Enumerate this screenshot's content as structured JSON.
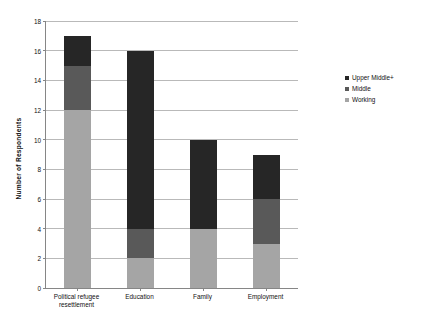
{
  "chart_data": {
    "type": "bar",
    "subtype": "stacked-vertical",
    "title": "",
    "xlabel": "",
    "ylabel": "Number of Respondents",
    "ylim": [
      0,
      18
    ],
    "ytick_step": 2,
    "yticks": [
      0,
      2,
      4,
      6,
      8,
      10,
      12,
      14,
      16,
      18
    ],
    "ytick_labels": [
      "0",
      "2",
      "4",
      "6",
      "8",
      "10",
      "12",
      "14",
      "16",
      "18"
    ],
    "grid": true,
    "grid_axis": "y",
    "legend_position": "right",
    "categories": [
      "Political refugee resettlement",
      "Education",
      "Family",
      "Employment"
    ],
    "category_label_lines": [
      [
        "Political refugee",
        "resettlement"
      ],
      [
        "Education"
      ],
      [
        "Family"
      ],
      [
        "Employment"
      ]
    ],
    "series": [
      {
        "name": "Working",
        "color": "#a5a5a5",
        "values": [
          12,
          2,
          4,
          3
        ]
      },
      {
        "name": "Middle",
        "color": "#595959",
        "values": [
          3,
          2,
          0,
          3
        ]
      },
      {
        "name": "Upper Middle+",
        "color": "#262626",
        "values": [
          2,
          12,
          6,
          3
        ]
      }
    ],
    "stack_totals": [
      17,
      16,
      10,
      9
    ],
    "legend_entries": [
      {
        "label": "Upper Middle+",
        "color": "#262626"
      },
      {
        "label": "Middle",
        "color": "#595959"
      },
      {
        "label": "Working",
        "color": "#a5a5a5"
      }
    ]
  },
  "colors": {
    "axis": "#868686",
    "gridline": "#b9b9b9",
    "text": "#111111",
    "background": "#ffffff"
  }
}
